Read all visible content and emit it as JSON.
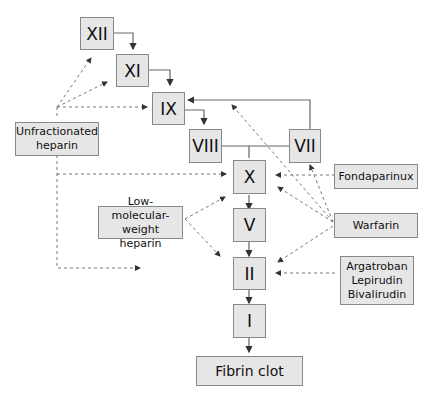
{
  "factors": {
    "xii": "XII",
    "xi": "XI",
    "ix": "IX",
    "viii": "VIII",
    "vii": "VII",
    "x": "X",
    "v": "V",
    "ii": "II",
    "i": "I",
    "clot": "Fibrin clot"
  },
  "drugs": {
    "ufh": "Unfractionated heparin",
    "lmwh": "Low-molecular-weight heparin",
    "fonda": "Fondaparinux",
    "warfarin": "Warfarin",
    "dti": [
      "Argatroban",
      "Lepirudin",
      "Bivalirudin"
    ]
  }
}
